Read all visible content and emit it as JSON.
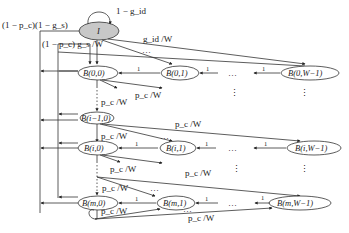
{
  "diagram": {
    "type": "markov-chain",
    "idle_state": {
      "label": "I",
      "self_loop": "1 − g_id"
    },
    "edge_labels": {
      "idle_to_stage0": "g_id /W",
      "top_left_1": "(1 − p_c)(1 − g_s)",
      "top_left_2": "(1 − p_c) g_s /W",
      "collision": "p_c /W",
      "decrement": "1",
      "ellipsis": "…",
      "vdots": "⋮"
    },
    "nodes": {
      "B00": "B(0,0)",
      "B01": "B(0,1)",
      "B0W": "B(0,W−1)",
      "Bi10": "B(i−1,0)",
      "Bi0": "B(i,0)",
      "Bi1": "B(i,1)",
      "BiW": "B(i,W−1)",
      "Bm0": "B(m,0)",
      "Bm1": "B(m,1)",
      "BmW": "B(m,W−1)"
    }
  }
}
